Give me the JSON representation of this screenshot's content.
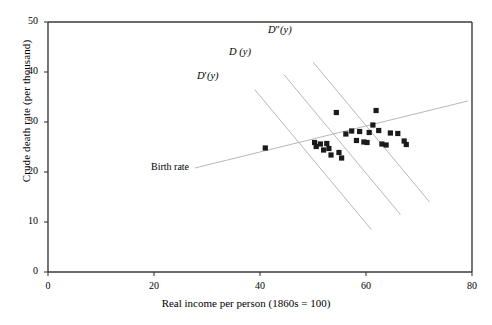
{
  "chart_data": {
    "type": "scatter",
    "title": "",
    "xlabel": "Real income per person (1860s = 100)",
    "ylabel": "Crude death rate (per thousand)",
    "xlim": [
      0,
      80
    ],
    "ylim": [
      0,
      50
    ],
    "xticks": [
      0,
      20,
      40,
      60,
      80
    ],
    "yticks": [
      0,
      10,
      20,
      30,
      40,
      50
    ],
    "grid": false,
    "legend": "none",
    "marker": "filled-square",
    "marker_color": "#1a1a1a",
    "line_color": "#b8b8b8",
    "axis_color": "#3a3a3a",
    "points": [
      {
        "x": 41.0,
        "y": 24.8
      },
      {
        "x": 50.3,
        "y": 25.9
      },
      {
        "x": 50.6,
        "y": 25.1
      },
      {
        "x": 51.4,
        "y": 25.6
      },
      {
        "x": 52.0,
        "y": 24.4
      },
      {
        "x": 52.6,
        "y": 25.7
      },
      {
        "x": 53.0,
        "y": 24.7
      },
      {
        "x": 53.4,
        "y": 23.4
      },
      {
        "x": 54.4,
        "y": 31.9
      },
      {
        "x": 54.9,
        "y": 23.9
      },
      {
        "x": 55.4,
        "y": 22.8
      },
      {
        "x": 56.2,
        "y": 27.6
      },
      {
        "x": 57.3,
        "y": 28.2
      },
      {
        "x": 58.2,
        "y": 26.3
      },
      {
        "x": 58.8,
        "y": 28.1
      },
      {
        "x": 59.6,
        "y": 26.0
      },
      {
        "x": 60.2,
        "y": 25.9
      },
      {
        "x": 60.6,
        "y": 27.9
      },
      {
        "x": 61.3,
        "y": 29.4
      },
      {
        "x": 61.9,
        "y": 32.3
      },
      {
        "x": 62.4,
        "y": 28.3
      },
      {
        "x": 63.0,
        "y": 25.6
      },
      {
        "x": 63.8,
        "y": 25.4
      },
      {
        "x": 64.6,
        "y": 27.8
      },
      {
        "x": 66.0,
        "y": 27.7
      },
      {
        "x": 67.2,
        "y": 26.2
      },
      {
        "x": 67.6,
        "y": 25.5
      }
    ],
    "lines": [
      {
        "name": "D''(y)",
        "x0": 50.0,
        "y0": 42.0,
        "x1": 72.0,
        "y1": 14.0
      },
      {
        "name": "D(y)",
        "x0": 44.5,
        "y0": 39.5,
        "x1": 66.5,
        "y1": 11.5
      },
      {
        "name": "D'(y)",
        "x0": 39.0,
        "y0": 36.5,
        "x1": 61.0,
        "y1": 8.5
      },
      {
        "name": "Birth rate",
        "x0": 27.7,
        "y0": 20.8,
        "x1": 79.2,
        "y1": 34.2
      }
    ],
    "annotations": [
      {
        "text_parts": {
          "d": "D",
          "primes": "″",
          "arg": "(y)"
        },
        "name": "D''(y)",
        "x_px": 268,
        "y_px": 24
      },
      {
        "text_parts": {
          "d": "D",
          "primes": "",
          "arg": " (y)"
        },
        "name": "D(y)",
        "x_px": 229,
        "y_px": 46
      },
      {
        "text_parts": {
          "d": "D",
          "primes": "′",
          "arg": "(y)"
        },
        "name": "D'(y)",
        "x_px": 197,
        "y_px": 70
      },
      {
        "text": "Birth rate",
        "name": "Birth rate",
        "x_px": 151,
        "y_px": 161
      }
    ]
  }
}
